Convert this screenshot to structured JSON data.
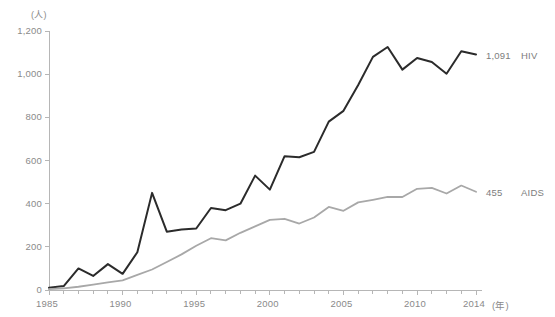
{
  "chart_data": {
    "type": "line",
    "title": "",
    "subtitle": "",
    "xlabel": "(年)",
    "ylabel": "(人)",
    "yunit": "(人)",
    "xunit": "(年)",
    "xlim": [
      1985,
      2014
    ],
    "ylim": [
      0,
      1200
    ],
    "grid": false,
    "legend_position": "right-inline",
    "x": [
      1985,
      1986,
      1987,
      1988,
      1989,
      1990,
      1991,
      1992,
      1993,
      1994,
      1995,
      1996,
      1997,
      1998,
      1999,
      2000,
      2001,
      2002,
      2003,
      2004,
      2005,
      2006,
      2007,
      2008,
      2009,
      2010,
      2011,
      2012,
      2013,
      2014
    ],
    "xticks": [
      1985,
      1990,
      1995,
      2000,
      2005,
      2010,
      2014
    ],
    "xticklabels": [
      "1985",
      "1990",
      "1995",
      "2000",
      "2005",
      "2010",
      "2014"
    ],
    "yticks": [
      0,
      200,
      400,
      600,
      800,
      1000,
      1200
    ],
    "yticklabels": [
      "0",
      "200",
      "400",
      "600",
      "800",
      "1,000",
      "1,200"
    ],
    "series": [
      {
        "name": "HIV",
        "color": "#2b2b2b",
        "end_label": "1,091",
        "end_name": "HIV",
        "values": [
          10,
          18,
          100,
          65,
          120,
          75,
          175,
          450,
          270,
          280,
          285,
          380,
          370,
          400,
          530,
          465,
          620,
          615,
          640,
          780,
          830,
          950,
          1080,
          1126,
          1021,
          1075,
          1056,
          1002,
          1106,
          1091
        ]
      },
      {
        "name": "AIDS",
        "color": "#a8a8a8",
        "end_label": "455",
        "end_name": "AIDS",
        "values": [
          4,
          8,
          15,
          25,
          35,
          45,
          70,
          95,
          130,
          165,
          205,
          240,
          230,
          265,
          295,
          325,
          330,
          308,
          336,
          385,
          367,
          406,
          418,
          431,
          431,
          469,
          473,
          447,
          484,
          455
        ]
      }
    ]
  }
}
